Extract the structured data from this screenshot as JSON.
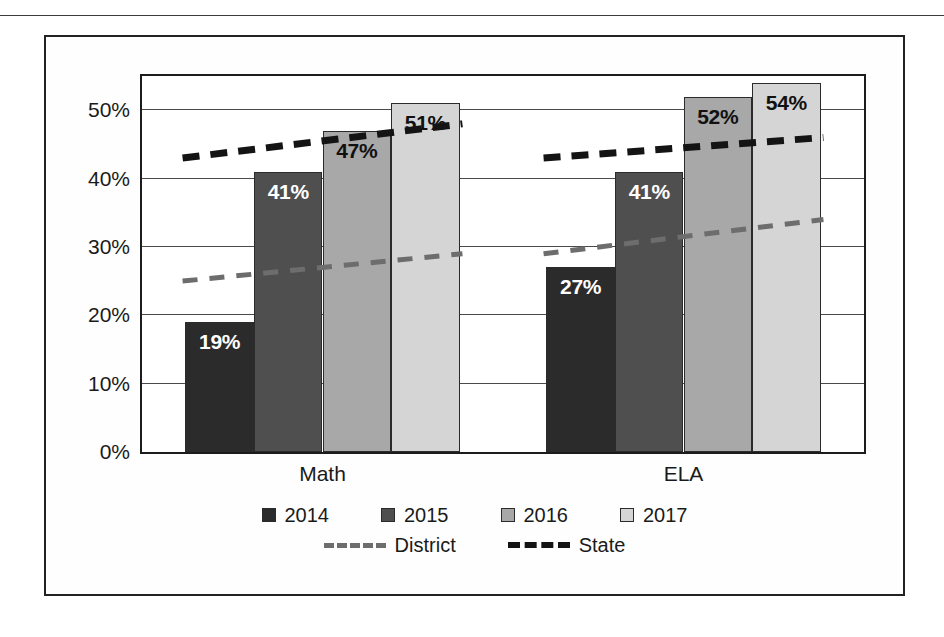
{
  "chart_data": {
    "type": "bar",
    "title": "",
    "subtitle": "",
    "xlabel": "",
    "ylabel": "",
    "categories": [
      "Math",
      "ELA"
    ],
    "series": [
      {
        "name": "2014",
        "values": [
          19,
          27
        ],
        "color": "#2b2b2b",
        "labels": [
          "19%",
          "27%"
        ]
      },
      {
        "name": "2015",
        "values": [
          41,
          41
        ],
        "color": "#4f4f4f",
        "labels": [
          "41%",
          "41%"
        ]
      },
      {
        "name": "2016",
        "values": [
          47,
          52
        ],
        "color": "#a8a8a8",
        "labels": [
          "47%",
          "52%"
        ]
      },
      {
        "name": "2017",
        "values": [
          51,
          54
        ],
        "color": "#d5d5d5",
        "labels": [
          "51%",
          "54%"
        ]
      }
    ],
    "trend_lines": [
      {
        "name": "District",
        "color": "#6d6d6d",
        "style": "dashed",
        "values": [
          [
            25,
            29
          ],
          [
            29,
            34
          ]
        ]
      },
      {
        "name": "State",
        "color": "#141414",
        "style": "dashed",
        "values": [
          [
            43,
            48
          ],
          [
            43,
            46
          ]
        ]
      }
    ],
    "ylim": [
      0,
      55
    ],
    "yticks": [
      0,
      10,
      20,
      30,
      40,
      50
    ],
    "ytick_labels": [
      "0%",
      "10%",
      "20%",
      "30%",
      "40%",
      "50%"
    ],
    "grid": true,
    "legend_position": "bottom"
  },
  "legend": {
    "years": [
      {
        "label": "2014",
        "color": "#2b2b2b"
      },
      {
        "label": "2015",
        "color": "#4f4f4f"
      },
      {
        "label": "2016",
        "color": "#a8a8a8"
      },
      {
        "label": "2017",
        "color": "#d5d5d5"
      }
    ],
    "lines": [
      {
        "label": "District",
        "color": "#6d6d6d"
      },
      {
        "label": "State",
        "color": "#141414"
      }
    ]
  }
}
